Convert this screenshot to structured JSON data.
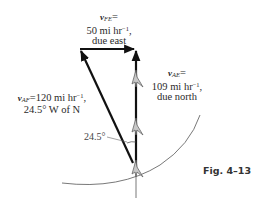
{
  "figure": {
    "caption": "Fig. 4–13"
  },
  "vectors": {
    "v_FE": {
      "symbol": "v",
      "subscript": "FE",
      "magnitude": "50 mi hr",
      "unit_exponent": "−1",
      "direction": "due east"
    },
    "v_AE": {
      "symbol": "v",
      "subscript": "AE",
      "magnitude": "109 mi hr",
      "unit_exponent": "−1",
      "direction": "due north"
    },
    "v_AF": {
      "symbol": "v",
      "subscript": "AF",
      "magnitude": "120 mi hr",
      "unit_exponent": "−1",
      "direction": "24.5° W of N"
    }
  },
  "angle_label": "24.5°",
  "colors": {
    "vector": "#111111",
    "arc": "#555555",
    "airplane": "#9a9a9a"
  }
}
